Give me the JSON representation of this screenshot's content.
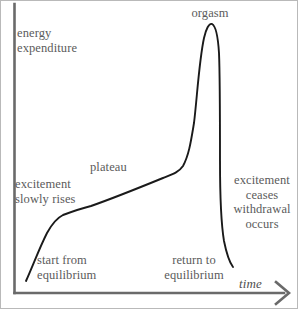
{
  "figure": {
    "axes": {
      "y_label": "energy\nexpenditure",
      "x_label": "time",
      "x_arrow_icon": "arrow-right-icon"
    },
    "annotations": {
      "peak": "orgasm",
      "plateau": "plateau",
      "rise": "excitement\nslowly rises",
      "resolution": "excitement\nceases\nwithdrawal\noccurs",
      "start": "start from\nequilibrium",
      "end": "return to\nequilibrium"
    },
    "colors": {
      "curve": "#1a1a1a",
      "axis": "#6a6a6a",
      "text": "#5b5b5b",
      "background": "#ffffff",
      "border": "#b9b9b9"
    }
  },
  "chart_data": {
    "type": "line",
    "title": "",
    "xlabel": "time",
    "ylabel": "energy expenditure",
    "grid": false,
    "legend": false,
    "axis_ticks": [],
    "xlim": [
      0,
      298
    ],
    "ylim": [
      0,
      309
    ],
    "phases": [
      {
        "name": "start from equilibrium",
        "x": 25,
        "y": 280
      },
      {
        "name": "excitement slowly rises",
        "x": 60,
        "y": 215
      },
      {
        "name": "plateau",
        "x": 130,
        "y": 190
      },
      {
        "name": "orgasm",
        "x": 207,
        "y": 22
      },
      {
        "name": "return to equilibrium",
        "x": 232,
        "y": 266
      }
    ],
    "curve_path": "M 25,280 C 33,262 38,248 46,232 C 52,221 56,217 62,214 C 70,211 78,208 90,205 C 110,198 140,186 162,177 C 172,173 178,171 182,165 C 188,154 190,140 193,122 C 196,98 198,60 203,37 C 205,28 208,22 211,23 C 215,25 217,36 218,52 C 219,75 219,120 219,160 C 219,196 220,222 223,240 C 226,255 229,262 232,266"
  }
}
